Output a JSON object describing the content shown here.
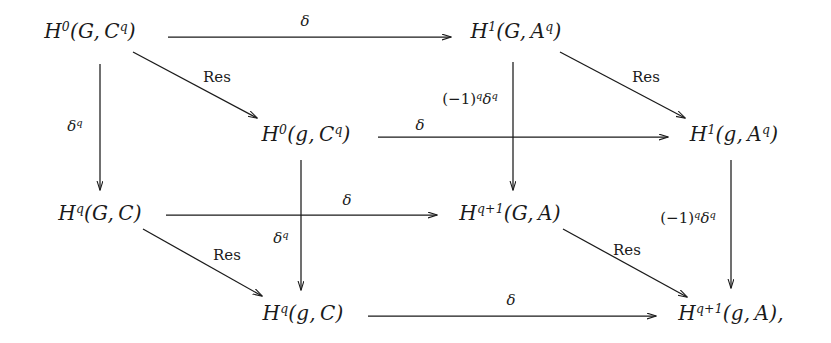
{
  "diagram": {
    "type": "commutative-diagram",
    "background_color": "#ffffff",
    "ink_color": "#1a1a1a",
    "nodes": [
      {
        "id": "n_H0_G_Cq",
        "label": "H0(G, Cq)",
        "x": 90,
        "y": 31,
        "row": 1,
        "col": 1
      },
      {
        "id": "n_H1_G_Aq",
        "label": "H1(G, Aq)",
        "x": 516,
        "y": 31,
        "row": 1,
        "col": 3
      },
      {
        "id": "n_H0_g_Cq",
        "label": "H0(g, Cq)",
        "x": 306,
        "y": 134,
        "row": 2,
        "col": 2
      },
      {
        "id": "n_H1_g_Aq",
        "label": "H1(g, Aq)",
        "x": 734,
        "y": 134,
        "row": 2,
        "col": 4
      },
      {
        "id": "n_Hq_G_C",
        "label": "Hq(G, C)",
        "x": 100,
        "y": 213,
        "row": 3,
        "col": 1
      },
      {
        "id": "n_Hq1_G_A",
        "label": "Hq+1(G, A)",
        "x": 510,
        "y": 213,
        "row": 3,
        "col": 3
      },
      {
        "id": "n_Hq_g_C",
        "label": "Hq(g, C)",
        "x": 303,
        "y": 313,
        "row": 4,
        "col": 2
      },
      {
        "id": "n_Hq1_g_A",
        "label": "Hq+1(g, A),",
        "x": 731,
        "y": 313,
        "row": 4,
        "col": 4
      }
    ],
    "arrow_labels": {
      "top_delta": "δ",
      "res_1": "Res",
      "delta_q_left": "δ",
      "mid_delta": "δ",
      "res_2": "Res",
      "sign_delta_mid": "(−1)",
      "row3_delta": "δ",
      "delta_q_mid": "δ",
      "res_3": "Res",
      "sign_delta_right": "(−1)",
      "bottom_delta": "δ"
    },
    "edges": [
      {
        "id": "e_top_horizontal",
        "from": "n_H0_G_Cq",
        "to": "n_H1_G_Aq",
        "label": "δ",
        "kind": "horizontal"
      },
      {
        "id": "e_res_top",
        "from": "n_H0_G_Cq",
        "to": "n_H0_g_Cq",
        "label": "Res",
        "kind": "diagonal"
      },
      {
        "id": "e_left_vertical",
        "from": "n_H0_G_Cq",
        "to": "n_Hq_G_C",
        "label": "δq",
        "kind": "vertical"
      },
      {
        "id": "e_mid_horizontal",
        "from": "n_H0_g_Cq",
        "to": "n_H1_g_Aq",
        "label": "δ",
        "kind": "horizontal"
      },
      {
        "id": "e_res_upper_right",
        "from": "n_H1_G_Aq",
        "to": "n_H1_g_Aq",
        "label": "Res",
        "kind": "diagonal"
      },
      {
        "id": "e_col3_vertical",
        "from": "n_H1_G_Aq",
        "to": "n_Hq1_G_A",
        "label": "(−1)qδq",
        "kind": "vertical"
      },
      {
        "id": "e_row3_horizontal",
        "from": "n_Hq_G_C",
        "to": "n_Hq1_G_A",
        "label": "δ",
        "kind": "horizontal"
      },
      {
        "id": "e_res_lower_left",
        "from": "n_Hq_G_C",
        "to": "n_Hq_g_C",
        "label": "Res",
        "kind": "diagonal"
      },
      {
        "id": "e_col2_vertical",
        "from": "n_H0_g_Cq",
        "to": "n_Hq_g_C",
        "label": "δq",
        "kind": "vertical"
      },
      {
        "id": "e_res_lower_right",
        "from": "n_Hq1_G_A",
        "to": "n_Hq1_g_A",
        "label": "Res",
        "kind": "diagonal"
      },
      {
        "id": "e_col4_vertical",
        "from": "n_H1_g_Aq",
        "to": "n_Hq1_g_A",
        "label": "(−1)qδq",
        "kind": "vertical"
      },
      {
        "id": "e_bottom_horizontal",
        "from": "n_Hq_g_C",
        "to": "n_Hq1_g_A",
        "label": "δ",
        "kind": "horizontal"
      }
    ]
  }
}
